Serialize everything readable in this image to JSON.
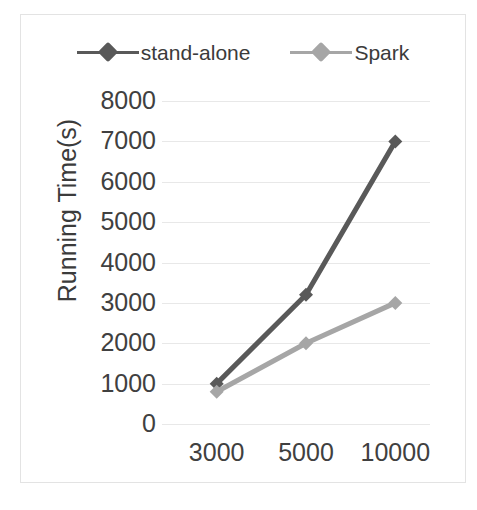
{
  "chart_data": {
    "type": "line",
    "title": "",
    "xlabel": "",
    "ylabel": "Running Time(s)",
    "categories": [
      "3000",
      "5000",
      "10000"
    ],
    "series": [
      {
        "name": "stand-alone",
        "values": [
          1000,
          3200,
          7000
        ],
        "color": "#595959"
      },
      {
        "name": "Spark",
        "values": [
          800,
          2000,
          3000
        ],
        "color": "#a6a6a6"
      }
    ],
    "ylim": [
      0,
      8000
    ],
    "yticks": [
      "8000",
      "7000",
      "6000",
      "5000",
      "4000",
      "3000",
      "2000",
      "1000",
      "0"
    ],
    "ytick_values": [
      8000,
      7000,
      6000,
      5000,
      4000,
      3000,
      2000,
      1000,
      0
    ],
    "grid": true,
    "grid_color": "#e8e8e8",
    "legend_position": "top",
    "marker": "diamond",
    "frame_color": "#e3e3e3",
    "background": "#ffffff"
  },
  "legend": {
    "entries": [
      {
        "label": "stand-alone",
        "color": "#595959"
      },
      {
        "label": "Spark",
        "color": "#a6a6a6"
      }
    ]
  },
  "axes": {
    "y_title": "Running Time(s)",
    "y_labels": [
      "8000",
      "7000",
      "6000",
      "5000",
      "4000",
      "3000",
      "2000",
      "1000",
      "0"
    ],
    "x_labels": [
      "3000",
      "5000",
      "10000"
    ]
  }
}
